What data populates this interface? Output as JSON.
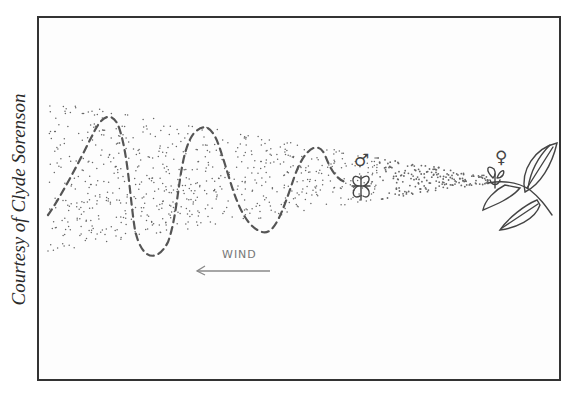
{
  "figure": {
    "credit": "Courtesy of Clyde Sorenson",
    "wind_label": "WIND",
    "male_symbol": "♂",
    "female_symbol": "♀",
    "colors": {
      "frame": "#333333",
      "ink": "#444444",
      "dots": "#666666",
      "wind": "#888888"
    }
  }
}
